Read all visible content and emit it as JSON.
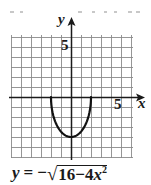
{
  "chart_data": {
    "type": "line",
    "title": "",
    "equation": "y = −√(16−4x²)",
    "xlabel": "x",
    "ylabel": "y",
    "xlim": [
      -6,
      6
    ],
    "ylim": [
      -6,
      6
    ],
    "grid": true,
    "grid_step": 1,
    "tick_labels": {
      "x": [
        "5"
      ],
      "y": [
        "5"
      ]
    },
    "series": [
      {
        "name": "y = −√(16−4x²)",
        "x": [
          -2,
          -1.9,
          -1.75,
          -1.5,
          -1,
          -0.5,
          0,
          0.5,
          1,
          1.5,
          1.75,
          1.9,
          2
        ],
        "y": [
          0,
          -1.25,
          -1.94,
          -2.65,
          -3.46,
          -3.87,
          -4,
          -3.87,
          -3.46,
          -2.65,
          -1.94,
          -1.25,
          0
        ]
      }
    ]
  },
  "labels": {
    "y_axis": "y",
    "x_axis": "x",
    "y_tick": "5",
    "x_tick": "5"
  },
  "equation": {
    "lhs": "y",
    "eq": "=",
    "neg": "−",
    "radical": "√",
    "radicand_const": "16−4",
    "radicand_var": "x",
    "radicand_exp": "2"
  },
  "colors": {
    "axis": "#1a1a1a",
    "grid": "#8a8a8a",
    "curve": "#111111"
  }
}
